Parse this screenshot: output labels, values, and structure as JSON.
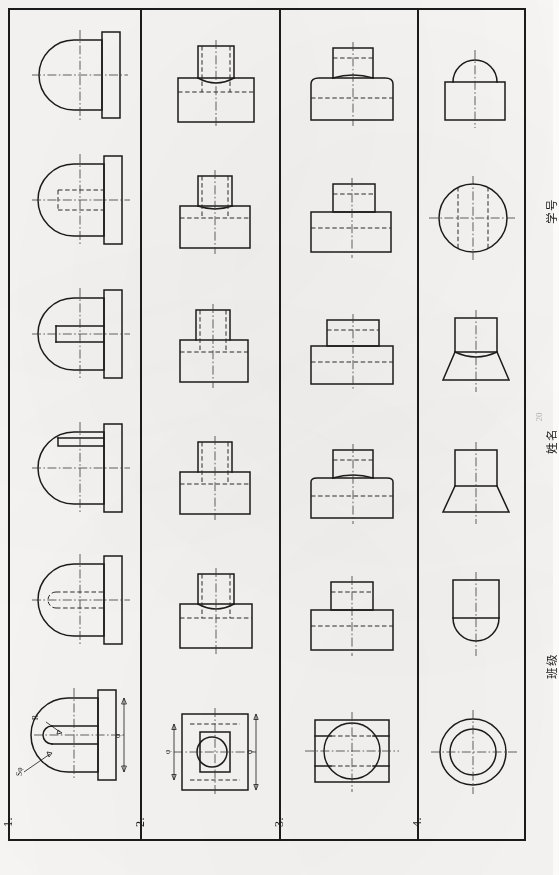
{
  "sheet": {
    "kind": "engineering-drawing-worksheet",
    "orientation": "rotated-90-ccw",
    "background_color": "#f8f7f5",
    "line_color": "#1b1b1b",
    "border_width_px": 2
  },
  "title_block": {
    "student_id_label": "学号",
    "name_label": "姓名",
    "class_label": "班级",
    "page_number": "20"
  },
  "rows": [
    {
      "number": "1.",
      "subject": "cylinder-with-hemispherical-end-and-flange",
      "dimension_labels": [
        "R",
        "Sφ",
        "φ"
      ],
      "views": [
        {
          "name": "front-view-dimensioned",
          "type": "bullet-nose-with-flange",
          "dimensioned": true
        },
        {
          "name": "variant-a",
          "type": "bullet-nose-with-flange-hidden-bore"
        },
        {
          "name": "variant-b",
          "type": "bullet-nose-stepped-flange"
        },
        {
          "name": "variant-c",
          "type": "bullet-nose-with-flange-slot"
        },
        {
          "name": "variant-d",
          "type": "bullet-nose-with-flange-hidden-bore"
        },
        {
          "name": "variant-e",
          "type": "bullet-nose-with-flange"
        }
      ]
    },
    {
      "number": "2.",
      "subject": "rectangular-base-with-cylindrical-boss-and-bore",
      "dimension_labels": [
        "φ",
        "φ"
      ],
      "views": [
        {
          "name": "top-view-dimensioned",
          "type": "square-plate-with-round-hole",
          "dimensioned": true
        },
        {
          "name": "variant-a",
          "type": "base-with-boss-curved-intersection"
        },
        {
          "name": "variant-b",
          "type": "base-with-boss-curved-intersection"
        },
        {
          "name": "variant-c",
          "type": "base-with-boss-straight-intersection"
        },
        {
          "name": "variant-d",
          "type": "base-with-boss-straight-intersection"
        },
        {
          "name": "variant-e",
          "type": "base-with-boss-curved-intersection"
        }
      ]
    },
    {
      "number": "3.",
      "subject": "cylindrical-base-with-smaller-cylinder-on-top",
      "dimension_labels": [],
      "views": [
        {
          "name": "top-view",
          "type": "rectangle-with-inscribed-circle"
        },
        {
          "name": "variant-a",
          "type": "flat-base-flat-boss"
        },
        {
          "name": "variant-b",
          "type": "curved-base-curved-boss"
        },
        {
          "name": "variant-c",
          "type": "flat-base-flat-boss-wide"
        },
        {
          "name": "variant-d",
          "type": "flat-base-flat-boss"
        },
        {
          "name": "variant-e",
          "type": "curved-base-curved-boss"
        }
      ]
    },
    {
      "number": "4.",
      "subject": "cylinder-with-spherical-and-conical-ends",
      "dimension_labels": [],
      "views": [
        {
          "name": "top-view",
          "type": "concentric-circles"
        },
        {
          "name": "variant-a",
          "type": "cylinder-with-hemisphere-below"
        },
        {
          "name": "variant-b",
          "type": "cylinder-with-cone-below"
        },
        {
          "name": "variant-c",
          "type": "cylinder-with-concave-cone-below"
        },
        {
          "name": "variant-d",
          "type": "circle-with-hidden-bore"
        },
        {
          "name": "variant-e",
          "type": "rectangle-with-dome-above"
        }
      ]
    }
  ]
}
